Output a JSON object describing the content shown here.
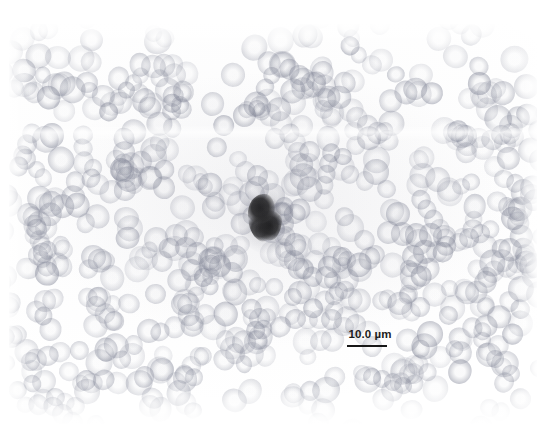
{
  "figure": {
    "kind": "light-micrograph",
    "background_color": "#ffffff"
  },
  "micrograph": {
    "plate": {
      "left": 9,
      "top": 24,
      "width": 528,
      "height": 400
    },
    "stain_tint": "#9aa0ad",
    "cells": {
      "erythrocyte_label": "erythrocyte",
      "dark_cell_label": "dark-stained-cell",
      "dark_cell_color": "#1b1b1b"
    }
  },
  "scale_bar": {
    "label": "10.0 µm",
    "value": 10.0,
    "unit": "µm",
    "bar_color": "#171717",
    "bar_length_px": 40,
    "text_color": "#1c1c1c"
  }
}
